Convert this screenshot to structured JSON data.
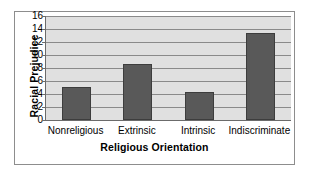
{
  "chart_data": {
    "type": "bar",
    "title": "",
    "subtitle": "",
    "xlabel": "Religious Orientation",
    "ylabel": "Racial Prejudice",
    "categories": [
      "Nonreligious",
      "Extrinsic",
      "Intrinsic",
      "Indiscriminate"
    ],
    "values": [
      5.1,
      8.6,
      4.3,
      13.4
    ],
    "series": [
      {
        "name": "Racial Prejudice",
        "values": [
          5.1,
          8.6,
          4.3,
          13.4
        ]
      }
    ],
    "ylim": [
      0,
      16
    ],
    "ytick_labels": [
      "0",
      "2",
      "4",
      "6",
      "8",
      "10",
      "12",
      "14",
      "16"
    ],
    "ytick_values": [
      0,
      2,
      4,
      6,
      8,
      10,
      12,
      14,
      16
    ],
    "grid": true,
    "grid_axis": "y",
    "legend": false,
    "legend_position": "none",
    "annotations": []
  },
  "style": {
    "bar_color": "#595959",
    "bar_border_color": "#3d3d3d",
    "plot_background": "#e0e0e0",
    "gridline_color": "#8a8a8a",
    "axis_color": "#6b6b6b",
    "frame_color": "#8d8d8d",
    "page_background": "#ffffff",
    "text_color": "#000000"
  }
}
